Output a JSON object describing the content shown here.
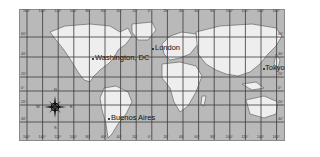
{
  "map": {
    "projection": "world grid map",
    "colors": {
      "ocean": "#b9b9b9",
      "land": "#eeeeee",
      "grid": "#3a3a3a",
      "coast": "#555555"
    },
    "longitude_labels_top": [
      "160°",
      "140°",
      "120°",
      "100°",
      "80°",
      "60°",
      "40°",
      "20°",
      "0°",
      "20°",
      "40°",
      "60°",
      "80°",
      "100°",
      "120°",
      "140°",
      "160°"
    ],
    "longitude_labels_bottom": [
      "160°",
      "140°",
      "120°",
      "100°",
      "80°",
      "60°",
      "40°",
      "20°",
      "0°",
      "20°",
      "40°",
      "60°",
      "80°",
      "100°",
      "120°",
      "140°",
      "160°"
    ],
    "latitude_labels_left": [
      "60°",
      "40°",
      "20°",
      "0°",
      "20°",
      "40°"
    ],
    "latitude_labels_right": [
      "60°",
      "40°",
      "20°",
      "0°",
      "20°",
      "40°"
    ],
    "cities": [
      {
        "name": "Washington, DC",
        "x": 93,
        "y": 57
      },
      {
        "name": "London",
        "x": 153,
        "y": 46
      },
      {
        "name": "Tokyo",
        "x": 264,
        "y": 67
      },
      {
        "name": "Buenos Aires",
        "x": 109,
        "y": 117
      }
    ],
    "compass": {
      "n": "N",
      "s": "S",
      "e": "E",
      "w": "W"
    }
  }
}
